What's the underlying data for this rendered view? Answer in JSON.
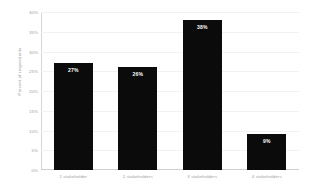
{
  "chart_data": {
    "type": "bar",
    "title": "",
    "xlabel": "",
    "ylabel": "Percent of respondents",
    "categories": [
      "1 stakeholder",
      "2 stakeholders",
      "3 stakeholders",
      "4 stakeholders"
    ],
    "values": [
      27,
      26,
      38,
      9
    ],
    "data_labels": [
      "27%",
      "26%",
      "38%",
      "9%"
    ],
    "ylim": [
      0,
      40
    ],
    "ytick_values": [
      0,
      5,
      10,
      15,
      20,
      25,
      30,
      35,
      40
    ],
    "ytick_labels": [
      "0%",
      "5%",
      "10%",
      "15%",
      "20%",
      "25%",
      "30%",
      "35%",
      "40%"
    ],
    "grid": true,
    "legend": false,
    "bar_color": "#0b0b0b",
    "data_label_color": "#ffffff",
    "axis_text_color": "#9e9e9e",
    "gridline_color": "#f2f2f2",
    "background_color": "#ffffff"
  }
}
